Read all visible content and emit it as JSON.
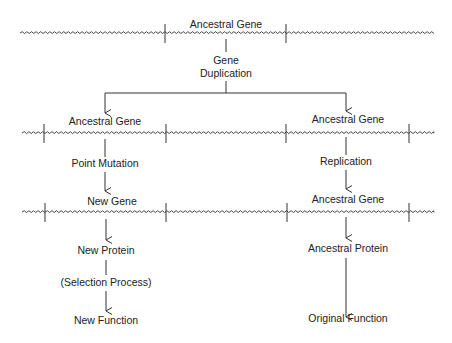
{
  "colors": {
    "stroke": "#333333",
    "text": "#222222",
    "background": "#ffffff"
  },
  "chromosomes": [
    {
      "id": "top",
      "y": 33,
      "x_start": 20,
      "x_end": 434,
      "ticks": [
        165,
        286
      ]
    },
    {
      "id": "middle",
      "y": 133,
      "x_start": 22,
      "x_end": 434,
      "ticks": [
        44,
        166,
        286,
        409
      ]
    },
    {
      "id": "bottom",
      "y": 212,
      "x_start": 22,
      "x_end": 434,
      "ticks": [
        45,
        166,
        287,
        409
      ]
    }
  ],
  "top": {
    "gene_label": "Ancestral Gene",
    "process_line1": "Gene",
    "process_line2": "Duplication"
  },
  "left_branch": {
    "gene_label": "Ancestral Gene",
    "process": "Point Mutation",
    "result_gene": "New Gene",
    "protein": "New Protein",
    "selection": "(Selection Process)",
    "function": "New Function"
  },
  "right_branch": {
    "gene_label": "Ancestral Gene",
    "process": "Replication",
    "result_gene": "Ancestral Gene",
    "protein": "Ancestral Protein",
    "function": "Original Function"
  }
}
